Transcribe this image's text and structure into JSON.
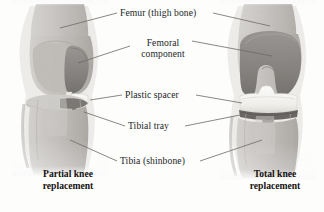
{
  "figure": {
    "type": "medical-illustration",
    "style": "grayscale pencil rendering",
    "colors": {
      "background": "#fdfdfc",
      "bone_fill": "#c9c7c4",
      "bone_shadow": "#a8a5a1",
      "implant_metal": "#8d8a87",
      "plastic_spacer": "#fbfbf9",
      "tray_dark": "#6e6b68",
      "leader_line": "#6d6a67",
      "text": "#211f1e"
    }
  },
  "labels": [
    {
      "id": "femur",
      "text": "Femur (thigh bone)"
    },
    {
      "id": "femoral_component",
      "text": "Femoral component",
      "line1": "Femoral",
      "line2": "component"
    },
    {
      "id": "plastic_spacer",
      "text": "Plastic spacer"
    },
    {
      "id": "tibial_tray",
      "text": "Tibial tray"
    },
    {
      "id": "tibia",
      "text": "Tibia (shinbone)"
    }
  ],
  "captions": {
    "left": {
      "line1": "Partial knee",
      "line2": "replacement"
    },
    "right": {
      "line1": "Total knee",
      "line2": "replacement"
    }
  }
}
